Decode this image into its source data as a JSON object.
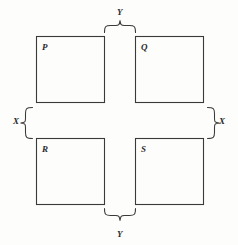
{
  "figure": {
    "title": "",
    "type": "geometric-diagram",
    "background_color": "#fdfdfc",
    "line_color": "#3a3a3a",
    "text_color": "#2b2b2b",
    "squares": [
      {
        "id": "P",
        "label": "P",
        "position": "top-left"
      },
      {
        "id": "Q",
        "label": "Q",
        "position": "top-right"
      },
      {
        "id": "R",
        "label": "R",
        "position": "bottom-left"
      },
      {
        "id": "S",
        "label": "S",
        "position": "bottom-right"
      }
    ],
    "braces": [
      {
        "id": "top",
        "label": "Y",
        "orientation": "horizontal",
        "points": "up",
        "spans": "gap between P and Q"
      },
      {
        "id": "bottom",
        "label": "Y",
        "orientation": "horizontal",
        "points": "down",
        "spans": "gap between R and S"
      },
      {
        "id": "left",
        "label": "X",
        "orientation": "vertical",
        "points": "left",
        "spans": "gap between P and R"
      },
      {
        "id": "right",
        "label": "X",
        "orientation": "vertical",
        "points": "right",
        "spans": "gap between Q and S"
      }
    ]
  }
}
